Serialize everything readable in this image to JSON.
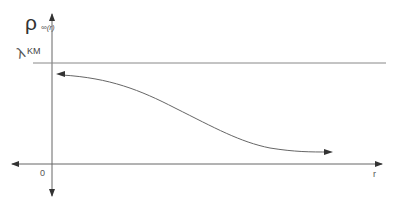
{
  "diagram": {
    "y_axis": {
      "symbol": "ρ",
      "subscript": "∞(r)"
    },
    "threshold": {
      "symbol": "λ",
      "subscript": "KM"
    },
    "x_axis": {
      "label": "r",
      "origin_label": "0"
    },
    "curve": {
      "description": "decreasing sigmoid-like curve from near threshold toward zero, arrows at both ends"
    },
    "colors": {
      "axis": "#555555",
      "line": "#777777",
      "background": "#ffffff"
    }
  }
}
